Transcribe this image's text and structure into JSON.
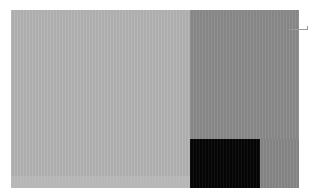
{
  "diagram": {
    "type": "treemap",
    "blocks": [
      {
        "id": "large-left",
        "x": 11,
        "y": 10,
        "w": 179,
        "h": 178,
        "color": "#b3b3b3"
      },
      {
        "id": "top-right",
        "x": 190,
        "y": 10,
        "w": 109,
        "h": 129,
        "color": "#8a8a8a"
      },
      {
        "id": "bottom-black",
        "x": 190,
        "y": 139,
        "w": 70,
        "h": 49,
        "color": "#050505"
      },
      {
        "id": "bottom-right",
        "x": 260,
        "y": 139,
        "w": 39,
        "h": 49,
        "color": "#878787"
      }
    ],
    "bottom_strip_color": "#bdbdbd"
  }
}
